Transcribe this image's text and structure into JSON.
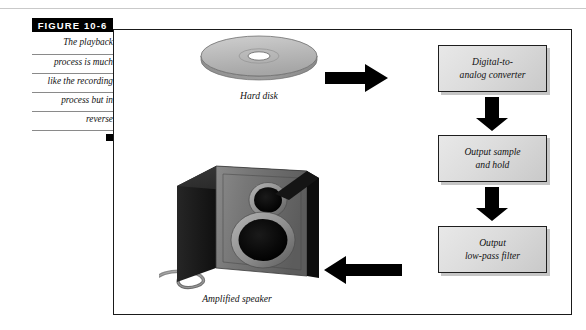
{
  "figure": {
    "tag": "FIGURE  10-6",
    "caption_lines": [
      "The playback",
      "process is much",
      "like the recording",
      "process but in",
      "reverse"
    ],
    "end_marker": "black-square"
  },
  "diagram": {
    "type": "flow",
    "source": {
      "name": "hard-disk",
      "label": "Hard disk"
    },
    "output_device": {
      "name": "amplified-speaker",
      "label": "Amplified speaker"
    },
    "boxes": [
      {
        "id": "dac",
        "line1": "Digital-to-",
        "line2": "analog converter"
      },
      {
        "id": "sample_hold",
        "line1": "Output sample",
        "line2": "and hold"
      },
      {
        "id": "low_pass",
        "line1": "Output",
        "line2": "low-pass filter"
      }
    ],
    "arrows": [
      {
        "id": "disk-to-dac",
        "direction": "right"
      },
      {
        "id": "dac-to-sample-hold",
        "direction": "down"
      },
      {
        "id": "sample-hold-to-low-pass",
        "direction": "down"
      },
      {
        "id": "low-pass-to-speaker",
        "direction": "left"
      }
    ]
  },
  "colors": {
    "ink": "#1a1a1a",
    "box_fill": "#dcdcdc",
    "rule": "#8a8a8a",
    "disk": "#b8b8b8",
    "speaker_front": "#6e6e6e",
    "speaker_top": "#2b2b2b"
  }
}
